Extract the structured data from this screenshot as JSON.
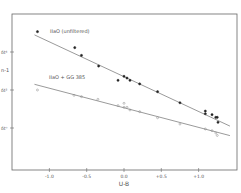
{
  "chart_data": {
    "type": "scatter",
    "title": "",
    "xlabel": "U-B",
    "ylabel": "n-1",
    "xlim": [
      -1.3,
      1.45
    ],
    "ylim": [
      -1.7,
      6.2
    ],
    "x_ticks": [
      "-1.0",
      "-0.5",
      "0.0",
      "+0.5",
      "+1.0"
    ],
    "x_tick_values": [
      -1.0,
      -0.5,
      0.0,
      0.5,
      1.0
    ],
    "y_ticks": [
      "δt⁴",
      "δt²",
      "δt⁰"
    ],
    "y_tick_values": [
      4,
      2,
      0
    ],
    "grid": false,
    "legend_position": "inline annotations",
    "series": [
      {
        "name": "IIaO (unfiltered)",
        "marker": "filled",
        "x": [
          -1.16,
          -0.66,
          -0.57,
          -0.34,
          -0.08,
          0.0,
          0.04,
          0.08,
          0.21,
          0.45,
          0.75,
          1.09,
          1.09,
          1.18,
          1.23,
          1.25,
          1.26
        ],
        "y": [
          5.07,
          4.23,
          3.82,
          3.26,
          2.51,
          2.72,
          2.63,
          2.51,
          2.32,
          1.91,
          1.33,
          0.89,
          0.75,
          0.7,
          0.56,
          0.56,
          0.3
        ],
        "fit_line": {
          "x": [
            -1.2,
            1.42
          ],
          "y": [
            4.9,
            0.1
          ]
        }
      },
      {
        "name": "IIaO + GG 385",
        "marker": "open",
        "x": [
          -1.16,
          -0.67,
          -0.57,
          -0.35,
          -0.08,
          0.0,
          0.0,
          0.04,
          0.08,
          0.21,
          0.45,
          0.75,
          1.09,
          1.18,
          1.23,
          1.25
        ],
        "y": [
          2.0,
          1.72,
          1.65,
          1.51,
          1.18,
          1.3,
          1.09,
          1.09,
          0.95,
          0.86,
          0.54,
          0.21,
          -0.05,
          -0.14,
          -0.26,
          -0.39
        ],
        "fit_line": {
          "x": [
            -1.2,
            1.42
          ],
          "y": [
            2.3,
            -0.4
          ]
        }
      }
    ]
  }
}
